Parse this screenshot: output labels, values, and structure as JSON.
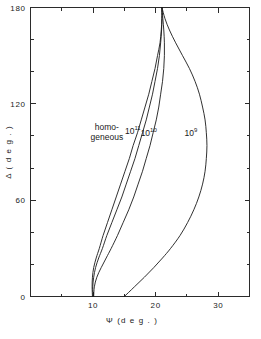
{
  "chart_data": {
    "type": "line",
    "title": "",
    "xlabel": "Ψ (deg.)",
    "ylabel": "Δ (deg.)",
    "xlim": [
      0,
      35
    ],
    "ylim": [
      0,
      180
    ],
    "grid": false,
    "legend_position": "inline-annotations",
    "x_ticks_major": [
      10,
      20,
      30
    ],
    "x_tick_labels": [
      "10",
      "20",
      "30"
    ],
    "x_ticks_minor": [
      5,
      15,
      25
    ],
    "y_ticks_major": [
      0,
      60,
      120,
      180
    ],
    "y_tick_labels": [
      "0",
      "60",
      "120",
      "180"
    ],
    "y_ticks_minor": [
      20,
      40,
      80,
      100,
      140,
      160
    ],
    "series": [
      {
        "name": "homogeneous",
        "label_text": "homo-\ngeneous",
        "label_x": 12.2,
        "label_y": 104,
        "points": [
          [
            9.9,
            0
          ],
          [
            9.85,
            6
          ],
          [
            9.9,
            12
          ],
          [
            10.1,
            18
          ],
          [
            10.5,
            24
          ],
          [
            11.0,
            30
          ],
          [
            11.6,
            38
          ],
          [
            12.3,
            46
          ],
          [
            13.0,
            54
          ],
          [
            13.7,
            62
          ],
          [
            14.4,
            70
          ],
          [
            15.1,
            78
          ],
          [
            15.8,
            86
          ],
          [
            16.4,
            94
          ],
          [
            17.1,
            102
          ],
          [
            17.7,
            110
          ],
          [
            18.3,
            118
          ],
          [
            18.9,
            126
          ],
          [
            19.4,
            134
          ],
          [
            19.9,
            142
          ],
          [
            20.3,
            150
          ],
          [
            20.7,
            158
          ],
          [
            20.9,
            166
          ],
          [
            21.0,
            173
          ],
          [
            21.0,
            180
          ]
        ]
      },
      {
        "name": "10^11",
        "label_text": "10",
        "label_sup": "11",
        "label_x": 15.1,
        "label_y": 101,
        "points": [
          [
            10.0,
            0
          ],
          [
            9.95,
            6
          ],
          [
            10.1,
            12
          ],
          [
            10.4,
            18
          ],
          [
            10.9,
            24
          ],
          [
            11.5,
            30
          ],
          [
            12.2,
            38
          ],
          [
            13.0,
            46
          ],
          [
            13.8,
            54
          ],
          [
            14.6,
            62
          ],
          [
            15.3,
            70
          ],
          [
            16.0,
            78
          ],
          [
            16.7,
            86
          ],
          [
            17.3,
            94
          ],
          [
            17.9,
            102
          ],
          [
            18.5,
            110
          ],
          [
            19.0,
            118
          ],
          [
            19.5,
            126
          ],
          [
            19.9,
            134
          ],
          [
            20.3,
            142
          ],
          [
            20.6,
            150
          ],
          [
            20.8,
            158
          ],
          [
            20.95,
            166
          ],
          [
            21.0,
            173
          ],
          [
            21.0,
            180
          ]
        ]
      },
      {
        "name": "10^10",
        "label_text": "10",
        "label_sup": "10",
        "label_x": 17.6,
        "label_y": 100,
        "points": [
          [
            10.1,
            0
          ],
          [
            10.2,
            6
          ],
          [
            10.6,
            12
          ],
          [
            11.3,
            18
          ],
          [
            12.1,
            24
          ],
          [
            12.9,
            30
          ],
          [
            13.9,
            38
          ],
          [
            14.8,
            46
          ],
          [
            15.7,
            54
          ],
          [
            16.5,
            62
          ],
          [
            17.2,
            70
          ],
          [
            17.9,
            78
          ],
          [
            18.5,
            86
          ],
          [
            19.1,
            94
          ],
          [
            19.6,
            102
          ],
          [
            20.1,
            110
          ],
          [
            20.5,
            118
          ],
          [
            20.8,
            126
          ],
          [
            21.1,
            134
          ],
          [
            21.3,
            142
          ],
          [
            21.4,
            150
          ],
          [
            21.4,
            158
          ],
          [
            21.3,
            166
          ],
          [
            21.15,
            173
          ],
          [
            21.0,
            180
          ]
        ]
      },
      {
        "name": "10^9",
        "label_text": "10",
        "label_sup": "9",
        "label_x": 24.6,
        "label_y": 100,
        "points": [
          [
            15.0,
            0
          ],
          [
            16.6,
            6
          ],
          [
            18.2,
            12
          ],
          [
            19.7,
            18
          ],
          [
            21.1,
            24
          ],
          [
            22.4,
            30
          ],
          [
            23.9,
            38
          ],
          [
            25.1,
            46
          ],
          [
            26.1,
            54
          ],
          [
            26.9,
            62
          ],
          [
            27.5,
            70
          ],
          [
            27.9,
            78
          ],
          [
            28.1,
            86
          ],
          [
            28.2,
            94
          ],
          [
            28.1,
            102
          ],
          [
            27.9,
            110
          ],
          [
            27.5,
            118
          ],
          [
            27.0,
            126
          ],
          [
            26.3,
            134
          ],
          [
            25.4,
            142
          ],
          [
            24.3,
            150
          ],
          [
            23.2,
            158
          ],
          [
            22.2,
            166
          ],
          [
            21.5,
            173
          ],
          [
            21.0,
            180
          ]
        ]
      }
    ]
  },
  "axes": {
    "x_title": "Ψ  (d e g . )",
    "y_title": "Δ  ( d e g . )"
  }
}
